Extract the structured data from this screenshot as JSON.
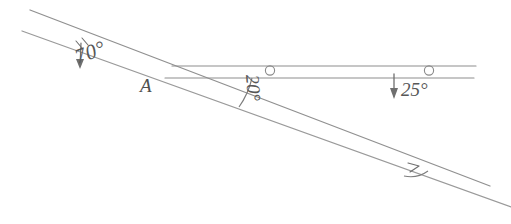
{
  "figure": {
    "type": "geometry-diagram",
    "background_color": "#ffffff",
    "line_color": "#8d8d8d",
    "text_color": "#575757",
    "width": 511,
    "height": 224
  },
  "labels": {
    "angle_70": "70°",
    "vertex_A": "A",
    "angle_20": "20°",
    "angle_25": "25°"
  },
  "marks": {
    "circle_left": "o",
    "circle_right": "o",
    "arrow_down_70": "down-arrow",
    "arrow_down_25": "down-arrow",
    "unlabeled_angle": "angle-arc-caret"
  },
  "geometry": {
    "slant_line_upper": {
      "x1": 30,
      "y1": 10,
      "x2": 490,
      "y2": 186
    },
    "slant_line_lower": {
      "x1": 22,
      "y1": 31,
      "x2": 511,
      "y2": 206
    },
    "horizontal_line_upper": {
      "x1": 172,
      "y1": 66,
      "x2": 476,
      "y2": 66
    },
    "horizontal_line_lower": {
      "x1": 165,
      "y1": 78,
      "x2": 474,
      "y2": 78
    },
    "vertex_A_point": {
      "x": 170,
      "y": 72
    },
    "arc_20_center": {
      "x": 170,
      "y": 78
    },
    "arc_20_radius": 82,
    "arc_unlabeled_center": {
      "x": 400,
      "y": 160
    },
    "arc_unlabeled_radius": 28
  }
}
